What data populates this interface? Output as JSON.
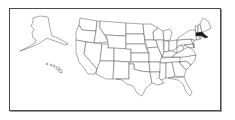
{
  "map": {
    "title": "",
    "region": "United States",
    "highlighted_state": "Massachusetts",
    "colors": {
      "frame": "#4a4a4a",
      "state_fill": "#ffffff",
      "state_border": "#555555",
      "highlight_fill": "#1a1a1a",
      "background": "#ffffff"
    },
    "insets": [
      "Alaska",
      "Hawaii"
    ]
  }
}
